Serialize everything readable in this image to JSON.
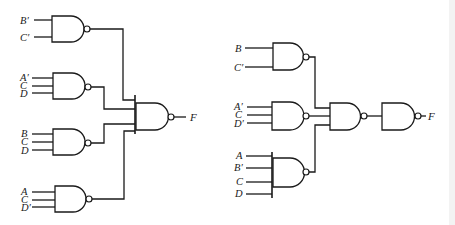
{
  "diagram": {
    "type": "logic-circuit",
    "colors": {
      "ink": "#1a1a1a",
      "background": "#ffffff"
    },
    "left_circuit": {
      "name": "Two-level NAND implementation",
      "first_level_gates": [
        {
          "id": "L1",
          "inputs": [
            "B′",
            "C′"
          ]
        },
        {
          "id": "L2",
          "inputs": [
            "A′",
            "C",
            "D"
          ]
        },
        {
          "id": "L3",
          "inputs": [
            "B",
            "C",
            "D"
          ]
        },
        {
          "id": "L4",
          "inputs": [
            "A",
            "C",
            "D′"
          ]
        }
      ],
      "output_gate": {
        "id": "L5",
        "inputs_from": [
          "L1",
          "L2",
          "L3",
          "L4"
        ],
        "output": "F"
      }
    },
    "right_circuit": {
      "name": "Multilevel NAND implementation",
      "first_level_gates": [
        {
          "id": "R1",
          "inputs": [
            "B",
            "C′"
          ]
        },
        {
          "id": "R2",
          "inputs": [
            "A′",
            "C",
            "D′"
          ]
        },
        {
          "id": "R3",
          "inputs": [
            "A",
            "B′",
            "C",
            "D"
          ]
        }
      ],
      "second_level_gate": {
        "id": "R4",
        "inputs_from": [
          "R1",
          "R2",
          "R3"
        ]
      },
      "inverter_gate": {
        "id": "R5",
        "inputs_from": [
          "R4"
        ],
        "output": "F"
      }
    }
  },
  "labels": {
    "l1": [
      "B′",
      "C′"
    ],
    "l2": [
      "A′",
      "C",
      "D"
    ],
    "l3": [
      "B",
      "C",
      "D"
    ],
    "l4": [
      "A",
      "C",
      "D′"
    ],
    "left_out": "F",
    "r1": [
      "B",
      "C′"
    ],
    "r2": [
      "A′",
      "C",
      "D′"
    ],
    "r3": [
      "A",
      "B′",
      "C",
      "D"
    ],
    "right_out": "F"
  }
}
